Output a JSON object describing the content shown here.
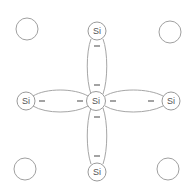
{
  "diagram": {
    "colors": {
      "stroke": "#9a9a9a",
      "text": "#555555",
      "electron": "#666666",
      "background": "#ffffff"
    },
    "atoms": [
      {
        "id": "center",
        "label": "Si",
        "x": 96,
        "y": 101,
        "r": 9.5
      },
      {
        "id": "top",
        "label": "Si",
        "x": 97,
        "y": 31,
        "r": 9
      },
      {
        "id": "left",
        "label": "Si",
        "x": 26,
        "y": 101,
        "r": 9
      },
      {
        "id": "right",
        "label": "Si",
        "x": 171,
        "y": 101,
        "r": 9
      },
      {
        "id": "bottom",
        "label": "Si",
        "x": 97,
        "y": 172,
        "r": 9
      }
    ],
    "empty_sites": [
      {
        "id": "top-left",
        "x": 27,
        "y": 29,
        "r": 11
      },
      {
        "id": "top-right",
        "x": 170,
        "y": 32,
        "r": 11
      },
      {
        "id": "bottom-left",
        "x": 25,
        "y": 169,
        "r": 11
      },
      {
        "id": "bottom-right",
        "x": 168,
        "y": 169,
        "r": 11
      }
    ],
    "bonds": [
      {
        "id": "bond-top",
        "electrons": [
          "−",
          "−"
        ]
      },
      {
        "id": "bond-left",
        "electrons": [
          "−",
          "−"
        ]
      },
      {
        "id": "bond-right",
        "electrons": [
          "−",
          "−"
        ]
      },
      {
        "id": "bond-bottom",
        "electrons": [
          "−",
          "−"
        ]
      }
    ]
  }
}
